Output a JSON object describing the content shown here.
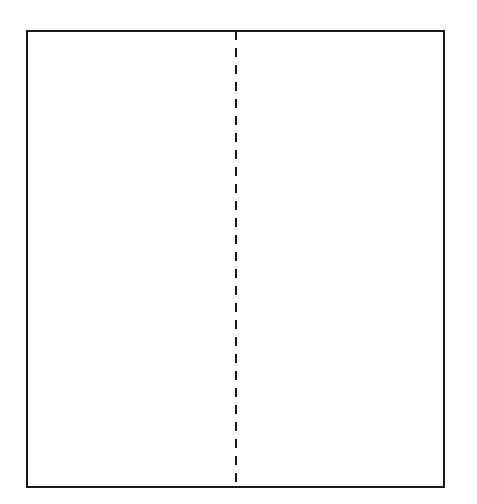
{
  "diagram": {
    "rectangle": {
      "x": 27,
      "y": 31,
      "width": 417,
      "height": 456,
      "stroke": "#1a1a1a",
      "stroke_width": 2
    },
    "divider": {
      "x": 236,
      "y1": 31,
      "y2": 487,
      "style": "dashed",
      "dash": "9 8",
      "stroke": "#1a1a1a",
      "stroke_width": 2
    },
    "background": "#ffffff"
  }
}
